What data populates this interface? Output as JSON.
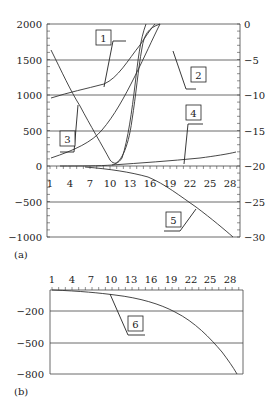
{
  "chart_data": [
    {
      "panel": "(a)",
      "type": "line",
      "title": "",
      "xlabel": "",
      "ylabel_left": "",
      "ylabel_right": "",
      "x_ticks": [
        "1",
        "4",
        "7",
        "10",
        "13",
        "16",
        "19",
        "22",
        "25",
        "28"
      ],
      "x_range": [
        1,
        30
      ],
      "left_y_ticks": [
        "2000",
        "1500",
        "1000",
        "500",
        "0",
        "−500",
        "−1000"
      ],
      "left_ylim": [
        -1000,
        2000
      ],
      "right_y_ticks": [
        "0",
        "−5",
        "−10",
        "−15",
        "−20",
        "−25",
        "−30"
      ],
      "right_ylim": [
        -30,
        0
      ],
      "grid": "horizontal",
      "series": [
        {
          "name": "1",
          "axis": "left",
          "x": [
            1,
            4,
            7,
            9,
            11,
            13,
            15,
            17
          ],
          "values": [
            950,
            1030,
            1110,
            1170,
            1320,
            1560,
            1820,
            2000
          ]
        },
        {
          "name": "2",
          "axis": "right",
          "x": [
            1,
            4,
            7,
            10,
            12,
            14,
            16,
            18,
            20
          ],
          "values": [
            -18.6,
            -16.5,
            -14.8,
            -12.5,
            -10.8,
            -8.8,
            -6.5,
            -3.5,
            0
          ]
        },
        {
          "name": "3",
          "axis": "left",
          "x": [
            1,
            3,
            5,
            7,
            9,
            10,
            11,
            12,
            13,
            14,
            15,
            16,
            17
          ],
          "values": [
            1640,
            1250,
            920,
            650,
            360,
            200,
            60,
            40,
            300,
            900,
            1500,
            1900,
            2000
          ]
        },
        {
          "name": "4",
          "axis": "right",
          "x": [
            1,
            5,
            9,
            13,
            17,
            21,
            25,
            29
          ],
          "values": [
            -19.9,
            -19.8,
            -19.7,
            -19.5,
            -19.2,
            -18.8,
            -18.3,
            -17.8
          ]
        },
        {
          "name": "5",
          "axis": "left",
          "x": [
            1,
            7,
            11,
            14,
            16,
            19,
            22,
            25,
            28
          ],
          "values": [
            0,
            -15,
            -40,
            -70,
            -110,
            -240,
            -480,
            -720,
            -1000
          ]
        },
        {
          "name": "curve-u",
          "axis": "right",
          "x": [
            8,
            10,
            12,
            14,
            15,
            16,
            17
          ],
          "values": [
            -20,
            -18,
            -15,
            -11,
            -8,
            -3.5,
            0
          ]
        }
      ],
      "annotations": [
        "1",
        "2",
        "3",
        "4",
        "5"
      ]
    },
    {
      "panel": "(b)",
      "type": "line",
      "title": "",
      "x_ticks": [
        "1",
        "4",
        "7",
        "10",
        "13",
        "16",
        "19",
        "22",
        "25",
        "28"
      ],
      "x_range": [
        1,
        30
      ],
      "y_ticks": [
        "−200",
        "−500",
        "−800"
      ],
      "ylim": [
        -800,
        50
      ],
      "grid": "horizontal",
      "series": [
        {
          "name": "6",
          "x": [
            1,
            4,
            7,
            10,
            13,
            16,
            18,
            20,
            22,
            24,
            26,
            28
          ],
          "values": [
            0,
            -15,
            -35,
            -60,
            -90,
            -140,
            -200,
            -280,
            -380,
            -500,
            -640,
            -800
          ]
        }
      ],
      "annotations": [
        "6"
      ]
    }
  ],
  "labels": {
    "panel_a": "(a)",
    "panel_b": "(b)",
    "callouts": [
      "1",
      "2",
      "3",
      "4",
      "5",
      "6"
    ]
  }
}
